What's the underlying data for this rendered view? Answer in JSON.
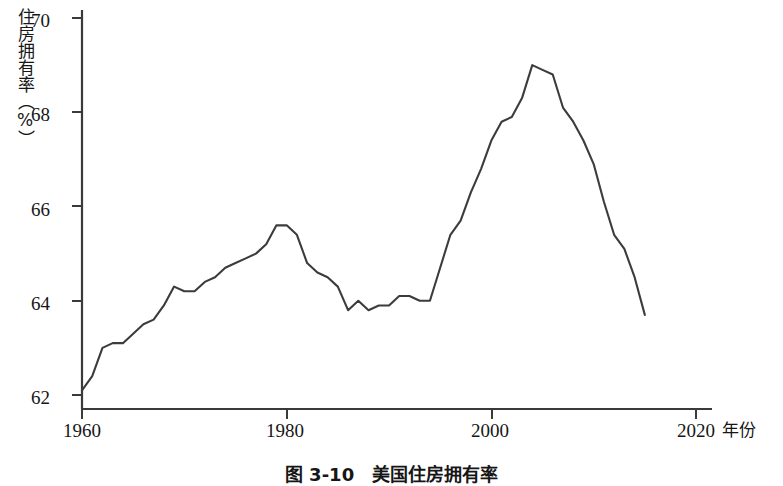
{
  "chart_data": {
    "type": "line",
    "title": "",
    "xlabel": "年份",
    "ylabel": "住房拥有率（%）",
    "xlim": [
      1960,
      2020
    ],
    "ylim": [
      61.4,
      70.0
    ],
    "grid": false,
    "legend": null,
    "x_ticks": [
      "1960",
      "1980",
      "2000",
      "2020"
    ],
    "x_tick_values": [
      1960,
      1980,
      2000,
      2020
    ],
    "y_ticks": [
      "62",
      "64",
      "66",
      "68",
      "70"
    ],
    "y_tick_values": [
      62,
      64,
      66,
      68,
      70
    ],
    "series": [
      {
        "name": "住房拥有率",
        "x": [
          1960,
          1961,
          1962,
          1963,
          1964,
          1965,
          1966,
          1967,
          1968,
          1969,
          1970,
          1971,
          1972,
          1973,
          1974,
          1975,
          1976,
          1977,
          1978,
          1979,
          1980,
          1981,
          1982,
          1983,
          1984,
          1985,
          1986,
          1987,
          1988,
          1989,
          1990,
          1991,
          1992,
          1993,
          1994,
          1995,
          1996,
          1997,
          1998,
          1999,
          2000,
          2001,
          2002,
          2003,
          2004,
          2005,
          2006,
          2007,
          2008,
          2009,
          2010,
          2011,
          2012,
          2013,
          2014,
          2015
        ],
        "values": [
          62.1,
          62.4,
          63.0,
          63.1,
          63.1,
          63.3,
          63.5,
          63.6,
          63.9,
          64.3,
          64.2,
          64.2,
          64.4,
          64.5,
          64.7,
          64.8,
          64.9,
          65.0,
          65.2,
          65.6,
          65.6,
          65.4,
          64.8,
          64.6,
          64.5,
          64.3,
          63.8,
          64.0,
          63.8,
          63.9,
          63.9,
          64.1,
          64.1,
          64.0,
          64.0,
          64.7,
          65.4,
          65.7,
          66.3,
          66.8,
          67.4,
          67.8,
          67.9,
          68.3,
          69.0,
          68.9,
          68.8,
          68.1,
          67.8,
          67.4,
          66.9,
          66.1,
          65.4,
          65.1,
          64.5,
          63.7
        ]
      }
    ]
  },
  "axis": {
    "y_title": "住房拥有率（%）",
    "x_title": "年份"
  },
  "caption": {
    "text": "图 3-10　美国住房拥有率"
  },
  "style": {
    "line_color": "#3c3c3c",
    "axis_color": "#3a3a3a",
    "background": "#ffffff"
  }
}
